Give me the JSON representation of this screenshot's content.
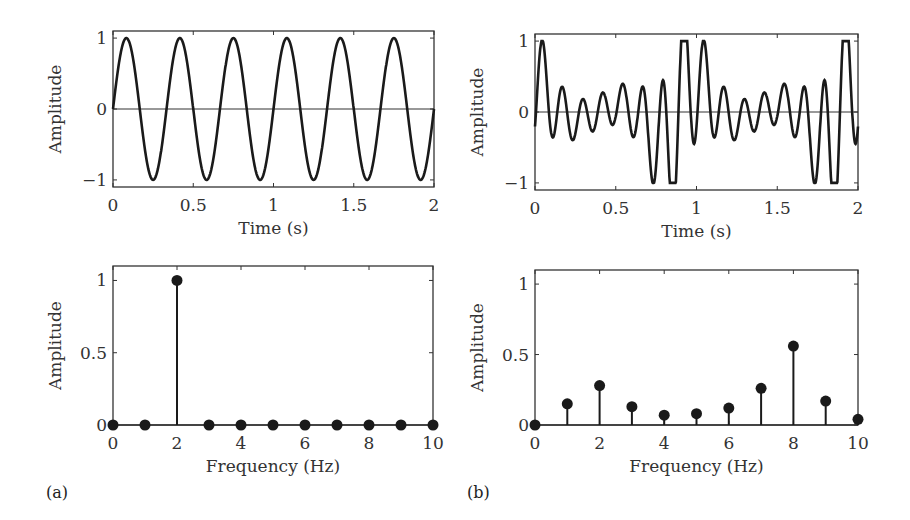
{
  "chart_data": [
    {
      "id": "a-time",
      "panel": "(a)",
      "type": "line",
      "xlabel": "Time (s)",
      "ylabel": "Amplitude",
      "xlim": [
        0,
        2
      ],
      "ylim": [
        -1.1,
        1.1
      ],
      "xticks": [
        "0",
        "0.5",
        "1",
        "1.5",
        "2"
      ],
      "yticks": [
        "-1",
        "0",
        "1"
      ],
      "signal": {
        "components": [
          {
            "freq": 3,
            "amp": 1
          }
        ]
      },
      "zero_line": true,
      "description": "Pure sinusoid, amplitude 1, 3 cycles per second over 0-2 s"
    },
    {
      "id": "b-time",
      "panel": "(b)",
      "type": "line",
      "xlabel": "Time (s)",
      "ylabel": "Amplitude",
      "xlim": [
        0,
        2
      ],
      "ylim": [
        -1.1,
        1.1
      ],
      "xticks": [
        "0",
        "0.5",
        "1",
        "1.5",
        "2"
      ],
      "yticks": [
        "-1",
        "0",
        "1"
      ],
      "zero_line": true,
      "description": "Composite multi-frequency signal with amplitude between -1 and 1"
    },
    {
      "id": "a-freq",
      "panel": "(a)",
      "type": "stem",
      "xlabel": "Frequency (Hz)",
      "ylabel": "Amplitude",
      "xlim": [
        0,
        10
      ],
      "ylim": [
        0,
        1.1
      ],
      "xticks": [
        "0",
        "2",
        "4",
        "6",
        "8",
        "10"
      ],
      "yticks": [
        "0",
        "0.5",
        "1"
      ],
      "x": [
        0,
        1,
        2,
        3,
        4,
        5,
        6,
        7,
        8,
        9,
        10
      ],
      "values": [
        0,
        0,
        1.0,
        0,
        0,
        0,
        0,
        0,
        0,
        0,
        0
      ]
    },
    {
      "id": "b-freq",
      "panel": "(b)",
      "type": "stem",
      "xlabel": "Frequency (Hz)",
      "ylabel": "Amplitude",
      "xlim": [
        0,
        10
      ],
      "ylim": [
        0,
        1.1
      ],
      "xticks": [
        "0",
        "2",
        "4",
        "6",
        "8",
        "10"
      ],
      "yticks": [
        "0",
        "0.5",
        "1"
      ],
      "x": [
        0,
        1,
        2,
        3,
        4,
        5,
        6,
        7,
        8,
        9,
        10
      ],
      "values": [
        0,
        0.15,
        0.28,
        0.13,
        0.07,
        0.08,
        0.12,
        0.26,
        0.56,
        0.17,
        0.04
      ]
    }
  ],
  "labels": {
    "panel_a": "(a)",
    "panel_b": "(b)",
    "time_xlabel": "Time (s)",
    "freq_xlabel": "Frequency (Hz)",
    "ylabel": "Amplitude"
  },
  "colors": {
    "line": "#1a1a1a",
    "axis": "#333333",
    "background": "#ffffff"
  }
}
